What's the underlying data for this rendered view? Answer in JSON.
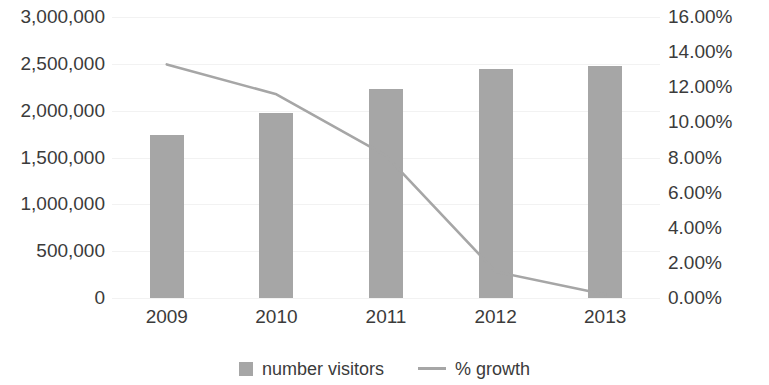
{
  "chart_data": {
    "type": "bar",
    "title": "",
    "subtitle": "",
    "xlabel": "",
    "ylabel": "",
    "y2label": "",
    "categories": [
      "2009",
      "2010",
      "2011",
      "2012",
      "2013"
    ],
    "grid": true,
    "legend_position": "bottom",
    "primary_axis": {
      "ticks": [
        "3,000,000",
        "2,500,000",
        "2,000,000",
        "1,500,000",
        "1,000,000",
        "500,000",
        "0"
      ],
      "tick_values": [
        3000000,
        2500000,
        2000000,
        1500000,
        1000000,
        500000,
        0
      ],
      "ylim": [
        0,
        3000000
      ],
      "step": 500000
    },
    "secondary_axis": {
      "ticks": [
        "16.00%",
        "14.00%",
        "12.00%",
        "10.00%",
        "8.00%",
        "6.00%",
        "4.00%",
        "2.00%",
        "0.00%"
      ],
      "tick_values": [
        16,
        14,
        12,
        10,
        8,
        6,
        4,
        2,
        0
      ],
      "ylim": [
        0,
        16
      ],
      "step": 2
    },
    "series": [
      {
        "name": "number visitors",
        "type": "bar",
        "axis": "primary",
        "color": "#a6a6a6",
        "values": [
          1740000,
          1980000,
          2230000,
          2445000,
          2475000
        ]
      },
      {
        "name": "% growth",
        "type": "line",
        "axis": "secondary",
        "color": "#a6a6a6",
        "values": [
          13.3,
          11.6,
          8.1,
          1.5,
          0.2
        ]
      }
    ]
  },
  "legend": {
    "entries": [
      {
        "label": "number visitors",
        "marker": "square-swatch-icon",
        "color": "#a6a6a6"
      },
      {
        "label": "% growth",
        "marker": "line-swatch-icon",
        "color": "#a6a6a6"
      }
    ]
  }
}
